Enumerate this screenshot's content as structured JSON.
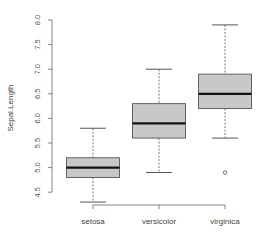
{
  "chart_data": {
    "type": "boxplot",
    "title": "",
    "xlabel": "",
    "ylabel": "Sepal.Length",
    "ylim": [
      4.3,
      8.0
    ],
    "yticks": [
      4.5,
      5.0,
      5.5,
      6.0,
      6.5,
      7.0,
      7.5,
      8.0
    ],
    "ytick_labels": [
      "4.5",
      "5.0",
      "5.5",
      "6.0",
      "6.5",
      "7.0",
      "7.5",
      "8.0"
    ],
    "categories": [
      "setosa",
      "versicolor",
      "virginica"
    ],
    "grid": false,
    "legend": null,
    "box_fill": "#c8c8c8",
    "series": [
      {
        "name": "setosa",
        "whisker_low": 4.3,
        "q1": 4.8,
        "median": 5.0,
        "q3": 5.2,
        "whisker_high": 5.8,
        "outliers": []
      },
      {
        "name": "versicolor",
        "whisker_low": 4.9,
        "q1": 5.6,
        "median": 5.9,
        "q3": 6.3,
        "whisker_high": 7.0,
        "outliers": []
      },
      {
        "name": "virginica",
        "whisker_low": 5.6,
        "q1": 6.2,
        "median": 6.5,
        "q3": 6.9,
        "whisker_high": 7.9,
        "outliers": [
          4.9
        ]
      }
    ]
  }
}
